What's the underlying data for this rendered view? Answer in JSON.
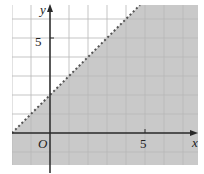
{
  "chart_data": {
    "type": "line",
    "title": "",
    "xlabel": "x",
    "ylabel": "y",
    "origin_label": "O",
    "x_ticks": [
      {
        "value": 5,
        "label": "5"
      }
    ],
    "y_ticks": [
      {
        "value": 5,
        "label": "5"
      }
    ],
    "xlim": [
      -2,
      7.7
    ],
    "ylim": [
      -1.7,
      6.7
    ],
    "grid": true,
    "grid_step": 1,
    "series": [
      {
        "name": "y = x + 2",
        "style": "dotted",
        "points": [
          [
            -2,
            0
          ],
          [
            4.7,
            6.7
          ]
        ]
      }
    ],
    "shaded_region": {
      "inequality": "y < x + 2",
      "description": "region below/right of the dotted boundary line shaded grey",
      "fill": "#c8c8c8"
    }
  },
  "colors": {
    "shade": "#c9c9c9",
    "grid": "#d9d9d9",
    "grid_on_shade": "#b9b9b9",
    "axis": "#2a2a2a",
    "boundary": "#555555"
  }
}
